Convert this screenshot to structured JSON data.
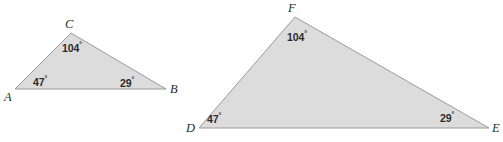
{
  "figure": {
    "type": "geometry-diagram",
    "background_color": "#ffffff",
    "shape_fill_color": "#dcdcdc",
    "shape_stroke_color": "#9a9a9a",
    "text_color": "#2b2b2b",
    "degree_symbol": "°",
    "shapes": [
      {
        "id": "triangle-abc",
        "name": "triangle-abc",
        "vertices": [
          {
            "label": "A",
            "x": 15,
            "y": 89,
            "label_x": 4,
            "label_y": 91
          },
          {
            "label": "B",
            "x": 166,
            "y": 89,
            "label_x": 170,
            "label_y": 83
          },
          {
            "label": "C",
            "x": 71,
            "y": 33,
            "label_x": 65,
            "label_y": 18
          }
        ],
        "angles": [
          {
            "at": "A",
            "value": "47",
            "label_x": 33,
            "label_y": 75
          },
          {
            "at": "B",
            "value": "29",
            "label_x": 120,
            "label_y": 76
          },
          {
            "at": "C",
            "value": "104",
            "label_x": 62,
            "label_y": 41
          }
        ]
      },
      {
        "id": "triangle-def",
        "name": "triangle-def",
        "vertices": [
          {
            "label": "D",
            "x": 199,
            "y": 128,
            "label_x": 186,
            "label_y": 122
          },
          {
            "label": "E",
            "x": 489,
            "y": 128,
            "label_x": 492,
            "label_y": 122
          },
          {
            "label": "F",
            "x": 295,
            "y": 17,
            "label_x": 288,
            "label_y": 2
          }
        ],
        "angles": [
          {
            "at": "D",
            "value": "47",
            "label_x": 207,
            "label_y": 112
          },
          {
            "at": "E",
            "value": "29",
            "label_x": 440,
            "label_y": 111
          },
          {
            "at": "F",
            "value": "104",
            "label_x": 287,
            "label_y": 30
          }
        ]
      }
    ]
  }
}
